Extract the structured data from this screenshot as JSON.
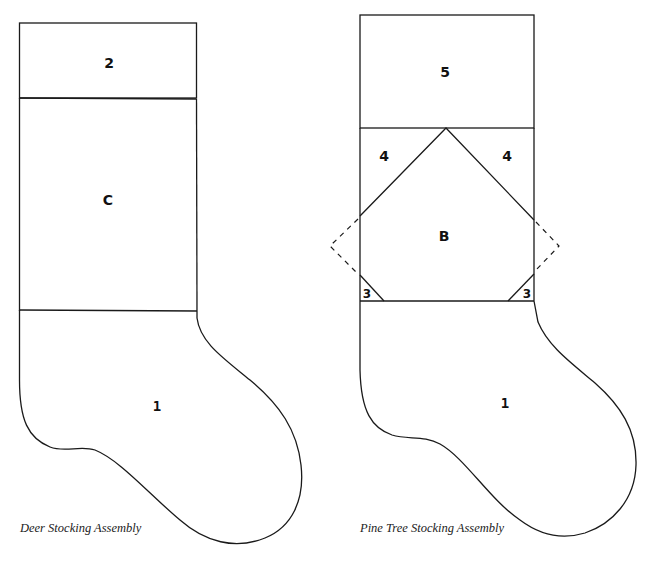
{
  "diagrams": [
    {
      "caption": "Deer Stocking Assembly",
      "pieces": {
        "cuff": "2",
        "panel": "C",
        "foot": "1"
      }
    },
    {
      "caption": "Pine Tree Stocking Assembly",
      "pieces": {
        "cuff": "5",
        "corner_left": "4",
        "corner_right": "4",
        "center": "B",
        "small_left": "3",
        "small_right": "3",
        "foot": "1"
      }
    }
  ],
  "colors": {
    "line": "#1a1a1a",
    "background": "#ffffff"
  }
}
